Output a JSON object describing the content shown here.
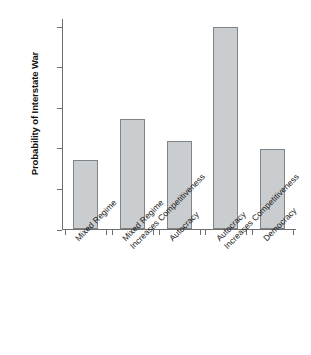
{
  "chart_data": {
    "type": "bar",
    "title": "",
    "subtitle": "",
    "xlabel": "",
    "ylabel": "Probability of Interstate War",
    "ylim": [
      0,
      0.52
    ],
    "grid": false,
    "legend": null,
    "categories": [
      "Mixed Regime",
      "Mixed Regime Increases Competitiveness",
      "Autocracy",
      "Autocracy Increases Competitiveness",
      "Democracy"
    ],
    "category_lines": [
      [
        "Mixed Regime",
        ""
      ],
      [
        "Mixed Regime",
        "Increases Competitiveness"
      ],
      [
        "Autocracy",
        ""
      ],
      [
        "Autocracy",
        "Increases Competitiveness"
      ],
      [
        "Democracy",
        ""
      ]
    ],
    "values": [
      0.17,
      0.27,
      0.217,
      0.497,
      0.197
    ],
    "ytick_values": [
      0,
      0.1,
      0.2,
      0.3,
      0.4,
      0.5
    ],
    "ytick_labels": [
      "0",
      ".10",
      ".20",
      ".30",
      ".40",
      ".50"
    ],
    "bar_fill_color": "#c9cdcf",
    "bar_border_color": "#7e8488",
    "axis_color": "#6e6e6e"
  }
}
